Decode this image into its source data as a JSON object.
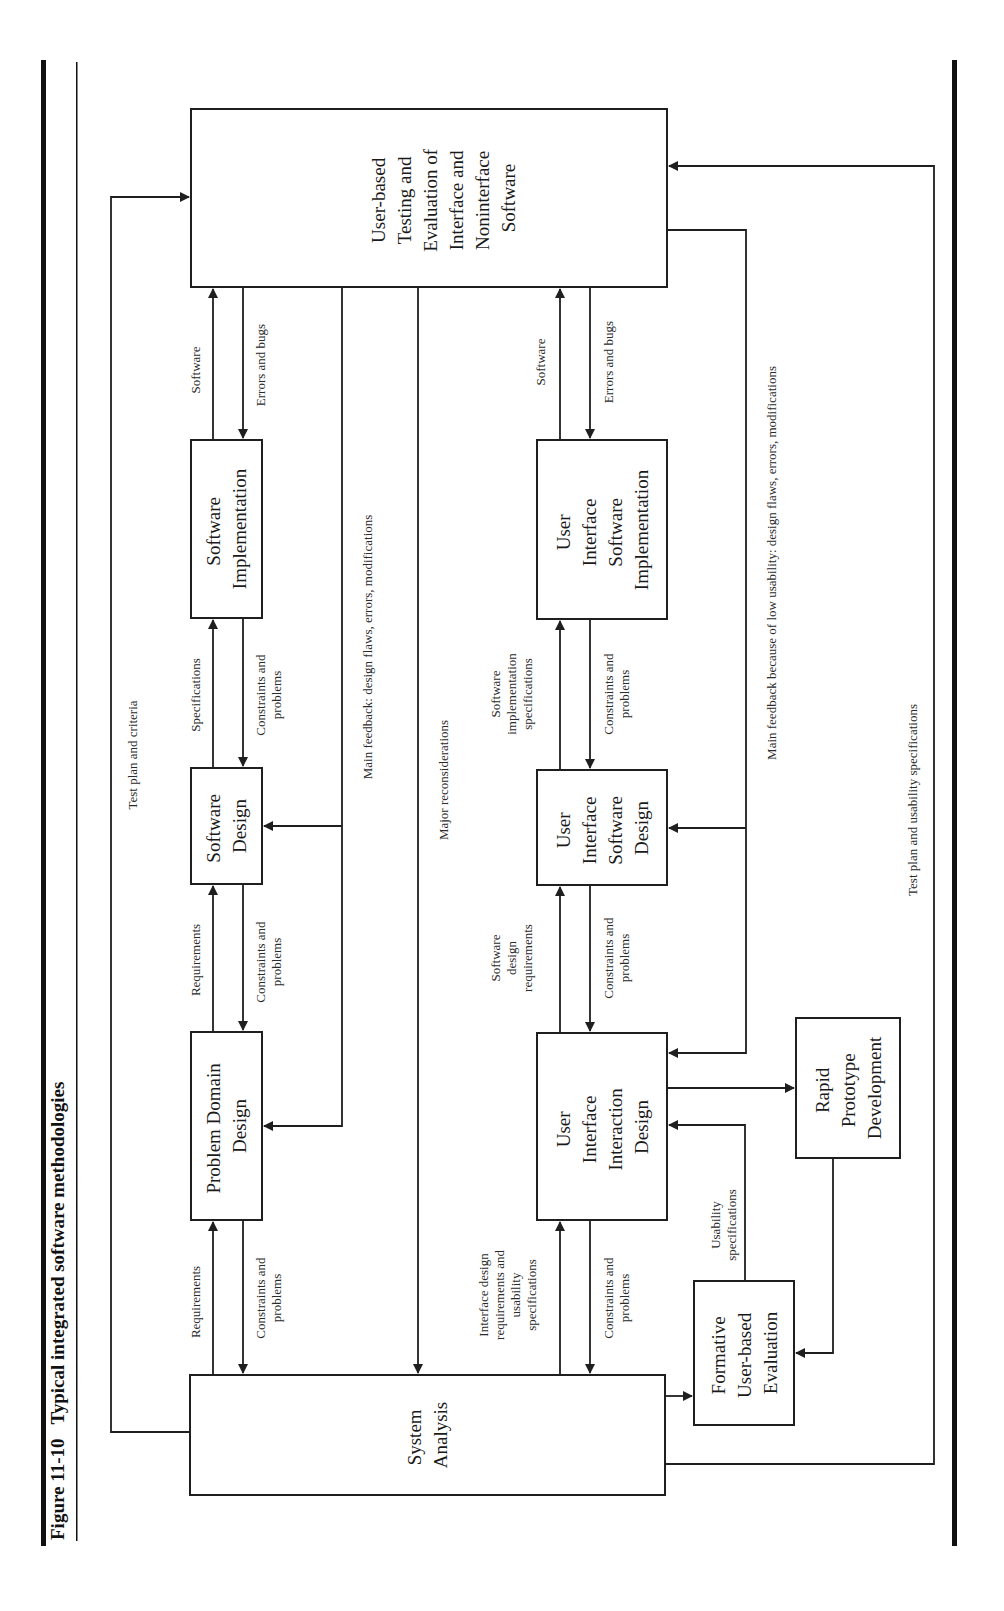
{
  "figure": {
    "number": "Figure 11-10",
    "title": "Typical integrated software methodologies",
    "orientation": "rotated 90° counter-clockwise"
  },
  "boxes": {
    "testing": [
      "User-based",
      "Testing and",
      "Evaluation of",
      "Interface and",
      "Noninterface",
      "Software"
    ],
    "software_implementation": [
      "Software",
      "Implementation"
    ],
    "software_design": [
      "Software",
      "Design"
    ],
    "problem_domain_design": [
      "Problem Domain",
      "Design"
    ],
    "system_analysis": [
      "System",
      "Analysis"
    ],
    "ui_software_implementation": [
      "User",
      "Interface",
      "Software",
      "Implementation"
    ],
    "ui_software_design": [
      "User",
      "Interface",
      "Software",
      "Design"
    ],
    "ui_interaction_design": [
      "User",
      "Interface",
      "Interaction",
      "Design"
    ],
    "rapid_prototype": [
      "Rapid",
      "Prototype",
      "Development"
    ],
    "formative_evaluation": [
      "Formative",
      "User-based",
      "Evaluation"
    ]
  },
  "labels": {
    "test_plan_criteria": "Test plan and criteria",
    "software_top": "Software",
    "errors_bugs_top": "Errors and bugs",
    "specifications": "Specifications",
    "constraints_top_1": [
      "Constraints and",
      "problems"
    ],
    "requirements_1": "Requirements",
    "constraints_top_2": [
      "Constraints and",
      "problems"
    ],
    "requirements_2": "Requirements",
    "constraints_top_3": [
      "Constraints and",
      "problems"
    ],
    "main_feedback_top": "Main feedback: design flaws, errors, modifications",
    "major_reconsiderations": "Major reconsiderations",
    "software_bottom": "Software",
    "errors_bugs_bottom": "Errors and bugs",
    "sw_impl_specs": [
      "Software",
      "implementation",
      "specifications"
    ],
    "constraints_bottom_1": [
      "Constraints and",
      "problems"
    ],
    "sw_design_reqs": [
      "Software",
      "design",
      "requirements"
    ],
    "constraints_bottom_2": [
      "Constraints and",
      "problems"
    ],
    "interface_design_reqs": [
      "Interface design",
      "requirements and",
      "usability",
      "specifications"
    ],
    "constraints_bottom_3": [
      "Constraints and",
      "problems"
    ],
    "usability_specs": [
      "Usability",
      "specifications"
    ],
    "main_feedback_bottom": "Main feedback because of low usability: design flaws, errors, modifications",
    "test_plan_usability": "Test plan and usability specifications"
  }
}
